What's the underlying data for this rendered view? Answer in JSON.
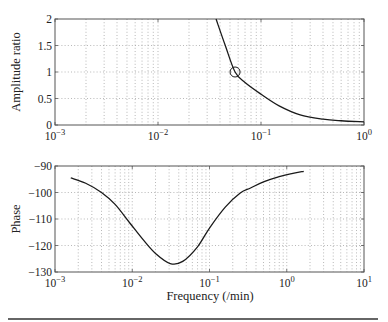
{
  "chart_data": [
    {
      "type": "line",
      "title": "",
      "xlabel": "",
      "ylabel": "Amplitude ratio",
      "xscale": "log",
      "xlim": [
        0.001,
        1
      ],
      "ylim": [
        0,
        2
      ],
      "grid": true,
      "xticks": [
        0.001,
        0.01,
        0.1,
        1
      ],
      "xtick_labels": [
        {
          "base": "10",
          "exp": "−3"
        },
        {
          "base": "10",
          "exp": "−2"
        },
        {
          "base": "10",
          "exp": "−1"
        },
        {
          "base": "10",
          "exp": "0"
        }
      ],
      "yticks": [
        0,
        0.5,
        1,
        1.5,
        2
      ],
      "ytick_labels": [
        "0",
        "0.5",
        "1",
        "1.5",
        "2"
      ],
      "series": [
        {
          "name": "amplitude ratio",
          "x": [
            0.0366,
            0.045,
            0.056,
            0.07,
            0.1,
            0.15,
            0.24,
            0.4,
            0.6,
            1.0
          ],
          "y": [
            2.0,
            1.5,
            1.0,
            0.8,
            0.58,
            0.36,
            0.19,
            0.11,
            0.08,
            0.06
          ]
        }
      ],
      "annotations": [
        {
          "type": "circle-marker",
          "x": 0.056,
          "y": 1.0,
          "note": "crossover at amplitude ratio 1"
        }
      ]
    },
    {
      "type": "line",
      "title": "",
      "xlabel": "Frequency (/min)",
      "ylabel": "Phase",
      "xscale": "log",
      "xlim": [
        0.001,
        10
      ],
      "ylim": [
        -130,
        -90
      ],
      "grid": true,
      "xticks": [
        0.001,
        0.01,
        0.1,
        1,
        10
      ],
      "xtick_labels": [
        {
          "base": "10",
          "exp": "−3"
        },
        {
          "base": "10",
          "exp": "−2"
        },
        {
          "base": "10",
          "exp": "−1"
        },
        {
          "base": "10",
          "exp": "0"
        },
        {
          "base": "10",
          "exp": "1"
        }
      ],
      "yticks": [
        -130,
        -120,
        -110,
        -100,
        -90
      ],
      "ytick_labels": [
        "−130",
        "−120",
        "−110",
        "−100",
        "−90"
      ],
      "series": [
        {
          "name": "phase",
          "x": [
            0.0016,
            0.0025,
            0.004,
            0.006,
            0.0093,
            0.014,
            0.02,
            0.031,
            0.045,
            0.07,
            0.1,
            0.16,
            0.25,
            0.34,
            0.5,
            0.8,
            1.2,
            1.66
          ],
          "y": [
            -94.5,
            -96.5,
            -100,
            -104.5,
            -111.5,
            -118,
            -123,
            -126.8,
            -126,
            -120.5,
            -113.4,
            -105.5,
            -100.2,
            -98.3,
            -96,
            -94,
            -92.8,
            -92
          ]
        }
      ]
    }
  ],
  "figure": {
    "top_ylabel": "Amplitude ratio",
    "bottom_ylabel": "Phase",
    "bottom_xlabel": "Frequency (/min)"
  }
}
